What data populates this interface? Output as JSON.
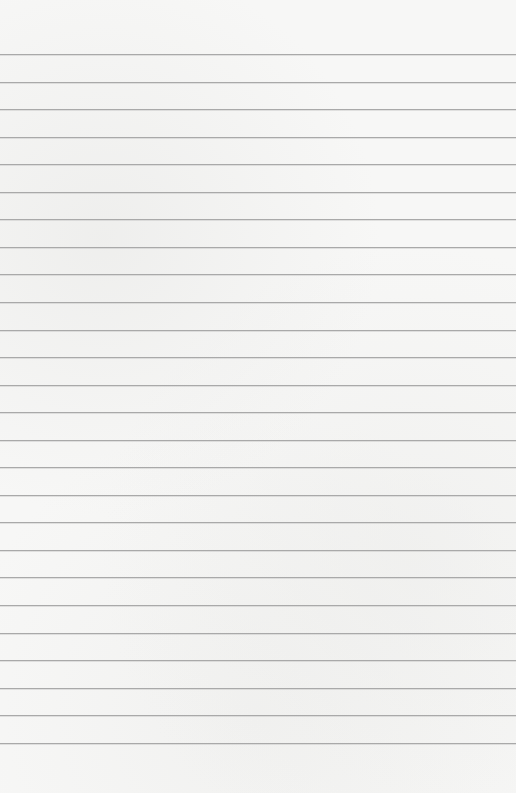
{
  "paper": {
    "type": "lined-paper",
    "background_color": "#f7f7f6",
    "line_color": "#a9a9a9",
    "first_line_y": 54,
    "line_spacing": 27.55,
    "line_count": 26
  }
}
